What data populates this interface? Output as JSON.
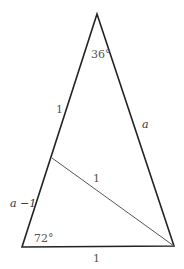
{
  "diagram": {
    "type": "golden triangle (isosceles 36-72-72)",
    "vertices": {
      "apex": [
        97,
        14
      ],
      "bottom_left": [
        22,
        247
      ],
      "bottom_right": [
        174,
        246
      ]
    },
    "inner_segment": {
      "from": [
        52,
        158
      ],
      "to": [
        174,
        246
      ]
    },
    "labels": {
      "apex_angle": "36°",
      "bottom_left_angle": "72°",
      "left_upper_side": "1",
      "left_lower_side": "a −1",
      "right_side": "a",
      "inner_segment": "1",
      "base": "1"
    },
    "colors": {
      "outline": "#222222",
      "inner_line": "#555555",
      "label": "#555555"
    }
  }
}
